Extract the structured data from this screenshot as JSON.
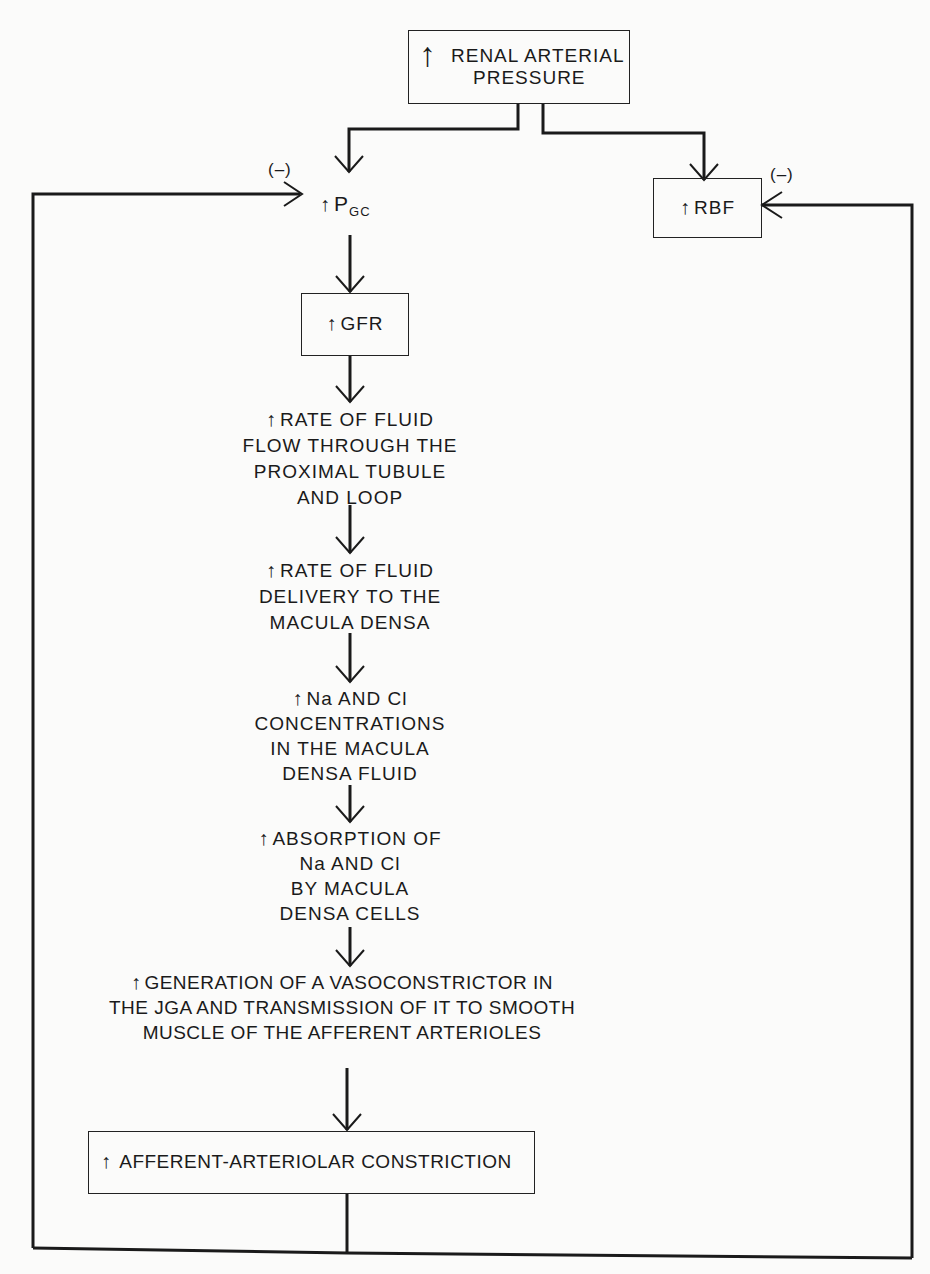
{
  "diagram": {
    "up_symbol": "↑",
    "negative_feedback_label": "(–)",
    "nodes": {
      "renal_arterial_pressure": {
        "lines": [
          "RENAL ARTERIAL",
          "PRESSURE"
        ],
        "boxed": true
      },
      "pgc": {
        "main": "P",
        "subscript": "GC",
        "boxed": false
      },
      "rbf": {
        "text": "RBF",
        "boxed": true
      },
      "gfr": {
        "text": "GFR",
        "boxed": true
      },
      "fluid_flow": {
        "lines": [
          "RATE OF FLUID",
          "FLOW THROUGH THE",
          "PROXIMAL TUBULE",
          "AND LOOP"
        ],
        "boxed": false
      },
      "fluid_delivery": {
        "lines": [
          "RATE OF FLUID",
          "DELIVERY TO THE",
          "MACULA DENSA"
        ],
        "boxed": false
      },
      "na_cl_concentration": {
        "lines": [
          "Na AND Cl",
          "CONCENTRATIONS",
          "IN THE MACULA",
          "DENSA FLUID"
        ],
        "boxed": false
      },
      "na_cl_absorption": {
        "lines": [
          "ABSORPTION OF",
          "Na AND Cl",
          "BY MACULA",
          "DENSA CELLS"
        ],
        "boxed": false
      },
      "vasoconstrictor": {
        "lines": [
          "GENERATION OF A VASOCONSTRICTOR IN",
          "THE JGA AND TRANSMISSION OF IT TO SMOOTH",
          "MUSCLE OF THE AFFERENT ARTERIOLES"
        ],
        "boxed": false
      },
      "afferent_constriction": {
        "text": "AFFERENT-ARTERIOLAR CONSTRICTION",
        "boxed": true
      }
    },
    "edges": [
      {
        "from": "renal_arterial_pressure",
        "to": "pgc"
      },
      {
        "from": "renal_arterial_pressure",
        "to": "rbf"
      },
      {
        "from": "pgc",
        "to": "gfr"
      },
      {
        "from": "gfr",
        "to": "fluid_flow"
      },
      {
        "from": "fluid_flow",
        "to": "fluid_delivery"
      },
      {
        "from": "fluid_delivery",
        "to": "na_cl_concentration"
      },
      {
        "from": "na_cl_concentration",
        "to": "na_cl_absorption"
      },
      {
        "from": "na_cl_absorption",
        "to": "vasoconstrictor"
      },
      {
        "from": "vasoconstrictor",
        "to": "afferent_constriction"
      },
      {
        "from": "afferent_constriction",
        "to": "pgc",
        "label": "(–)"
      },
      {
        "from": "afferent_constriction",
        "to": "rbf",
        "label": "(–)"
      }
    ]
  }
}
